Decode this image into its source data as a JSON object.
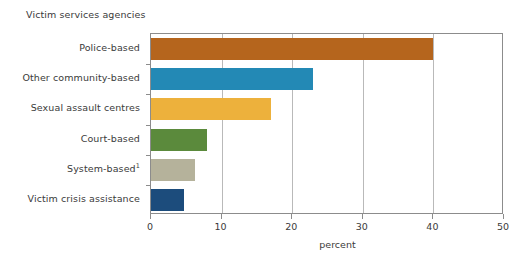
{
  "chart_data": {
    "type": "bar",
    "orientation": "horizontal",
    "title": "Victim services agencies",
    "xlabel": "percent",
    "ylabel": "",
    "categories": [
      "Police-based",
      "Other community-based",
      "Sexual assault centres",
      "Court-based",
      "System-based",
      "Victim crisis assistance"
    ],
    "category_footnotes": [
      "",
      "",
      "",
      "",
      "1",
      ""
    ],
    "values": [
      40.0,
      23.0,
      17.0,
      8.0,
      6.2,
      4.7
    ],
    "colors": [
      "#b5651d",
      "#2389b5",
      "#edb13c",
      "#5b8a3c",
      "#b5b29b",
      "#1c4c7c"
    ],
    "xlim": [
      0,
      50
    ],
    "xticks": [
      0,
      10,
      20,
      30,
      40,
      50
    ],
    "xticklabels": [
      "0",
      "10",
      "20",
      "30",
      "40",
      "50"
    ],
    "grid": true,
    "grid_axis": "x",
    "legend": false
  },
  "axis": {
    "tick_color": "#8c8c8c",
    "grid_color": "#b9b9b9"
  }
}
